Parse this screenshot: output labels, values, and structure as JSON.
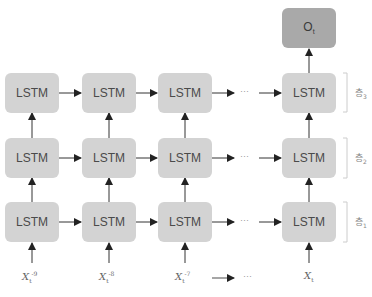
{
  "diagram": {
    "type": "stacked-lstm-unrolled",
    "cell_label": "LSTM",
    "output": {
      "label": "O",
      "subscript": "t"
    },
    "ellipsis": "···",
    "layers": [
      {
        "name": "층",
        "index": "3"
      },
      {
        "name": "층",
        "index": "2"
      },
      {
        "name": "층",
        "index": "1"
      }
    ],
    "inputs": [
      {
        "base": "X",
        "sub": "t",
        "sup": "-9"
      },
      {
        "base": "X",
        "sub": "t",
        "sup": "-8"
      },
      {
        "base": "X",
        "sub": "t",
        "sup": "-7"
      },
      {
        "base": "X",
        "sub": "t",
        "sup": ""
      }
    ],
    "colors": {
      "cell_fill": "#d3d3d3",
      "output_fill": "#a9a9a9",
      "arrow": "#222222",
      "bracket": "#cccccc"
    }
  }
}
